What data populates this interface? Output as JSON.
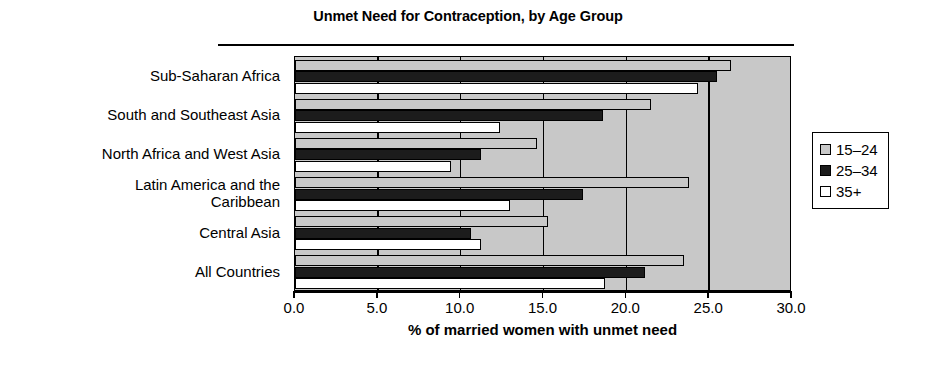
{
  "chart_data": {
    "type": "bar",
    "orientation": "horizontal",
    "title": "Unmet Need for Contraception, by Age Group",
    "xlabel": "% of married women with unmet need",
    "ylabel": "",
    "xlim": [
      0.0,
      30.0
    ],
    "xticks": [
      "0.0",
      "5.0",
      "10.0",
      "15.0",
      "20.0",
      "25.0",
      "30.0"
    ],
    "xtick_values": [
      0,
      5,
      10,
      15,
      20,
      25,
      30
    ],
    "grid": true,
    "legend_position": "right",
    "categories": [
      "Sub-Saharan Africa",
      "South and Southeast Asia",
      "North Africa and West Asia",
      "Latin America and the Caribbean",
      "Central Asia",
      "All Countries"
    ],
    "category_label_lines": [
      [
        "Sub-Saharan Africa"
      ],
      [
        "South and Southeast Asia"
      ],
      [
        "North Africa and West Asia"
      ],
      [
        "Latin America and the",
        "Caribbean"
      ],
      [
        "Central Asia"
      ],
      [
        "All Countries"
      ]
    ],
    "series": [
      {
        "name": "15–24",
        "color": "#c8c8c8",
        "values": [
          26.3,
          21.5,
          14.6,
          23.8,
          15.3,
          23.5
        ]
      },
      {
        "name": "25–34",
        "color": "#1c1c1c",
        "values": [
          25.5,
          18.6,
          11.2,
          17.4,
          10.6,
          21.1
        ]
      },
      {
        "name": "35+",
        "color": "#ffffff",
        "values": [
          24.3,
          12.4,
          9.4,
          13.0,
          11.2,
          18.7
        ]
      }
    ]
  },
  "legend": {
    "items": [
      {
        "label": "15–24",
        "color": "#c8c8c8"
      },
      {
        "label": "25–34",
        "color": "#1c1c1c"
      },
      {
        "label": "35+",
        "color": "#ffffff"
      }
    ]
  },
  "colors": {
    "plot_background": "#c8c8c8",
    "axis": "#000000",
    "page_background": "#ffffff"
  }
}
